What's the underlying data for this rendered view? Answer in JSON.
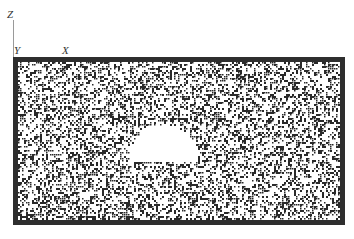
{
  "axes": {
    "z_label": "Z",
    "y_label": "Y",
    "x_label": "X"
  },
  "specimen": {
    "description": "Particle packing specimen with semi-circular cavity",
    "x": 13,
    "y": 57,
    "width": 332,
    "height": 168,
    "border_thickness": 5,
    "border_color": "#2e2e2e",
    "background_color": "#ffffff",
    "particle_color": "#2a2a2a",
    "particle_density": 0.42,
    "cavity": {
      "shape": "semi-dome",
      "left": 128,
      "right": 197,
      "top": 124,
      "bottom": 160
    }
  }
}
